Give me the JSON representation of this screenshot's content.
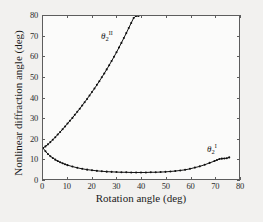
{
  "chart_data": {
    "type": "scatter",
    "title": "",
    "xlabel": "Rotation angle (deg)",
    "ylabel": "Nonlinear diffraction angle (deg)",
    "xlim": [
      0,
      80
    ],
    "ylim": [
      0,
      80
    ],
    "xticks": [
      0,
      10,
      20,
      30,
      40,
      50,
      60,
      70,
      80
    ],
    "yticks": [
      0,
      10,
      20,
      30,
      40,
      50,
      60,
      70,
      80
    ],
    "grid": false,
    "legend_position": "inline-annotation",
    "marker": "dot",
    "line_color": "#101010",
    "series": [
      {
        "name": "theta_2_II",
        "annotation": "θ",
        "annotation_sub": "2",
        "annotation_sup": "II",
        "x": [
          0,
          1,
          2,
          3,
          4,
          5,
          6,
          7,
          8,
          9,
          10,
          11,
          12,
          13,
          14,
          15,
          16,
          17,
          18,
          19,
          20,
          21,
          22,
          23,
          24,
          25,
          26,
          27,
          28,
          29,
          30,
          31,
          32,
          33,
          34,
          35,
          36,
          37,
          38,
          39
        ],
        "y": [
          15.2,
          16.0,
          17.0,
          18.1,
          19.3,
          20.5,
          21.8,
          23.1,
          24.4,
          25.8,
          27.2,
          28.6,
          30.0,
          31.5,
          33.0,
          34.5,
          36.1,
          37.7,
          39.3,
          41.0,
          42.7,
          44.4,
          46.2,
          48.0,
          49.9,
          51.8,
          53.8,
          55.8,
          57.9,
          60.0,
          62.2,
          64.5,
          66.8,
          69.2,
          71.6,
          74.1,
          76.6,
          79.0,
          80.0,
          80.0
        ]
      },
      {
        "name": "theta_2_I",
        "annotation": "θ",
        "annotation_sub": "2",
        "annotation_sup": "I",
        "x": [
          0,
          1,
          2,
          3,
          4,
          5,
          6,
          7,
          8,
          9,
          10,
          12,
          14,
          16,
          18,
          20,
          22,
          24,
          26,
          28,
          30,
          32,
          34,
          36,
          38,
          40,
          42,
          44,
          46,
          48,
          50,
          52,
          54,
          56,
          58,
          60,
          62,
          64,
          66,
          68,
          70,
          71,
          72,
          73,
          74,
          75,
          76
        ],
        "y": [
          15.2,
          13.6,
          12.3,
          11.2,
          10.3,
          9.5,
          8.8,
          8.2,
          7.7,
          7.2,
          6.8,
          6.1,
          5.5,
          5.0,
          4.6,
          4.3,
          4.0,
          3.8,
          3.6,
          3.5,
          3.4,
          3.3,
          3.3,
          3.2,
          3.2,
          3.2,
          3.2,
          3.3,
          3.3,
          3.4,
          3.5,
          3.7,
          3.9,
          4.2,
          4.5,
          5.0,
          5.6,
          6.2,
          7.0,
          7.9,
          8.8,
          9.3,
          9.8,
          10.0,
          10.1,
          10.2,
          10.6
        ]
      }
    ]
  }
}
